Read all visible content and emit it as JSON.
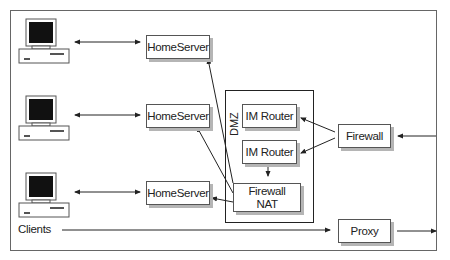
{
  "diagram": {
    "dmz_label": "DMZ",
    "clients_label": "Clients",
    "nodes": {
      "homeserver_1": "HomeServer",
      "homeserver_2": "HomeServer",
      "homeserver_3": "HomeServer",
      "im_router_1": "IM Router",
      "im_router_2": "IM Router",
      "firewall_nat_line1": "Firewall",
      "firewall_nat_line2": "NAT",
      "firewall": "Firewall",
      "proxy": "Proxy"
    },
    "edges": [
      {
        "from": "client_1",
        "to": "homeserver_1",
        "type": "bidirectional"
      },
      {
        "from": "client_2",
        "to": "homeserver_2",
        "type": "bidirectional"
      },
      {
        "from": "client_3",
        "to": "homeserver_3",
        "type": "bidirectional"
      },
      {
        "from": "firewall_nat",
        "to": "homeserver_1"
      },
      {
        "from": "firewall_nat",
        "to": "homeserver_2"
      },
      {
        "from": "firewall_nat",
        "to": "homeserver_3"
      },
      {
        "from": "im_router_2",
        "to": "firewall_nat"
      },
      {
        "from": "firewall",
        "to": "im_router_1"
      },
      {
        "from": "firewall",
        "to": "im_router_2"
      },
      {
        "from": "external",
        "to": "firewall"
      },
      {
        "from": "clients",
        "to": "proxy"
      },
      {
        "from": "proxy",
        "to": "external"
      }
    ],
    "colors": {
      "line": "#222222",
      "shadow": "#b5b5b5",
      "frame": "#666666",
      "screen": "#111111"
    }
  }
}
